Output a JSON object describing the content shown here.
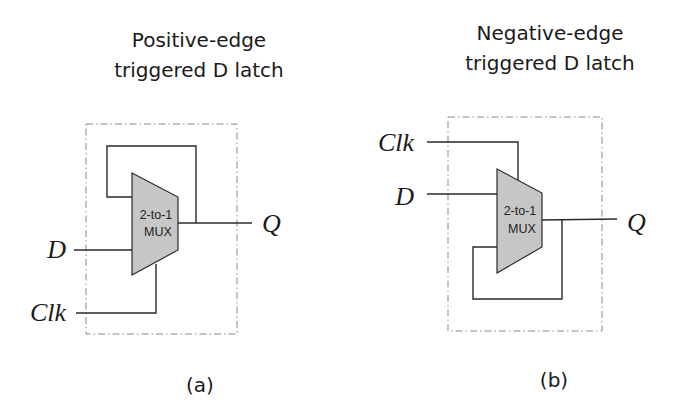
{
  "figure": {
    "colors": {
      "mux_fill": "#c6c6c6",
      "wire": "#2a2a2a",
      "boundary": "#8a8a8a",
      "text": "#1a1a1a"
    },
    "panels": [
      {
        "id": "a",
        "title_line1": "Positive-edge",
        "title_line2": "triggered D latch",
        "caption": "(a)",
        "mux_line1": "2-to-1",
        "mux_line2": "MUX",
        "inputs": {
          "d": "D",
          "clk": "Clk"
        },
        "output": "Q"
      },
      {
        "id": "b",
        "title_line1": "Negative-edge",
        "title_line2": "triggered D latch",
        "caption": "(b)",
        "mux_line1": "2-to-1",
        "mux_line2": "MUX",
        "inputs": {
          "clk": "Clk",
          "d": "D"
        },
        "output": "Q"
      }
    ]
  }
}
